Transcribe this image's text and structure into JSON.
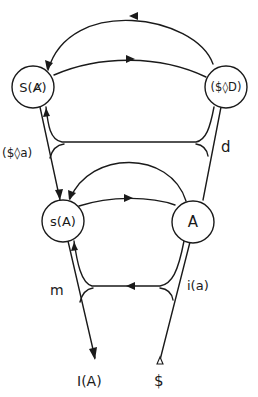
{
  "diagram": {
    "stroke_color": "#1a1a1a",
    "background": "#ffffff",
    "nodes": {
      "S_barred_A": {
        "label": "S(Ⱥ)"
      },
      "drive": {
        "label": "($◊D)"
      },
      "signified": {
        "label": "s(A)"
      },
      "other": {
        "label": "A"
      }
    },
    "edge_labels": {
      "fantasy": "($◊a)",
      "desire": "d",
      "ego": "m",
      "image": "i(a)"
    },
    "endpoints": {
      "ego_ideal": "I(A)",
      "subject": "$"
    }
  }
}
